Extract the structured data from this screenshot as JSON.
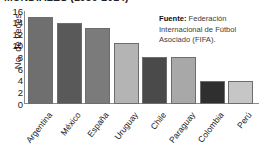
{
  "chart_data": {
    "type": "bar",
    "title": "MUNDIALES (1930-2014)",
    "subtitle": "",
    "xlabel": "",
    "ylabel": "No. de veces",
    "categories": [
      "Argentina",
      "México",
      "España",
      "Uruguay",
      "Chile",
      "Paraguay",
      "Colombia",
      "Perú"
    ],
    "values": [
      15,
      14,
      13,
      10.5,
      8,
      8,
      4,
      4
    ],
    "ylim": [
      0,
      16
    ],
    "yticks": [
      16,
      14,
      12,
      10,
      8,
      6,
      4,
      2,
      0
    ],
    "grid": false,
    "legend": false,
    "bar_colors": [
      "#6f6f6f",
      "#595959",
      "#7b7b7b",
      "#b4b4b4",
      "#4a4a4a",
      "#a8a8a8",
      "#2f2f2f",
      "#c6c6c6"
    ]
  },
  "annotations": {
    "source_label": "Fuente:",
    "source_text": " Federación Internacional de Fútbol Asociado (FIFA)."
  }
}
